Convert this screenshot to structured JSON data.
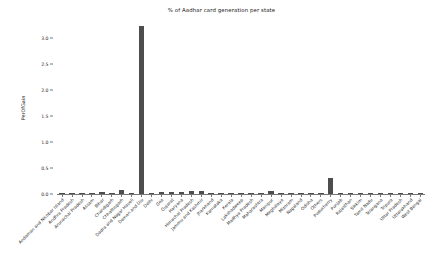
{
  "chart_data": {
    "type": "bar",
    "title": "% of Aadhar card generation per state",
    "xlabel": "",
    "ylabel": "PerOfGain",
    "ylim": [
      0.0,
      3.3
    ],
    "yticks": [
      "0.0",
      "0.5",
      "1.0",
      "1.5",
      "2.0",
      "2.5",
      "3.0"
    ],
    "ytick_values": [
      0.0,
      0.5,
      1.0,
      1.5,
      2.0,
      2.5,
      3.0
    ],
    "grid": false,
    "legend": null,
    "bar_color": "#4d4d4d",
    "categories": [
      "Andaman and Nicobar Island",
      "Andhra Pradesh",
      "Arunachal Pradesh",
      "Assam",
      "Bihar",
      "Chandigarh",
      "Chhattisgarh",
      "Dadra and Nagar Haveli",
      "Daman and Diu",
      "Delhi",
      "Goa",
      "Gujarat",
      "Haryana",
      "Himachal Pradesh",
      "Jammu and Kashmir",
      "Jharkhand",
      "Karnataka",
      "Kerala",
      "Lakshadweep",
      "Madhya Pradesh",
      "Maharashtra",
      "Manipur",
      "Meghalaya",
      "Mizoram",
      "Nagaland",
      "Odisha",
      "Others",
      "Puducherry",
      "Punjab",
      "Rajasthan",
      "Sikkim",
      "Tamil Nadu",
      "Telangana",
      "Tripura",
      "Uttar Pradesh",
      "Uttarakhand",
      "West Bengal"
    ],
    "values": [
      0.004,
      0.006,
      0.006,
      0.007,
      0.045,
      0.01,
      0.07,
      0.012,
      3.22,
      0.02,
      0.03,
      0.04,
      0.04,
      0.05,
      0.05,
      0.012,
      0.008,
      0.01,
      0.012,
      0.02,
      0.02,
      0.05,
      0.01,
      0.012,
      0.012,
      0.012,
      0.012,
      0.3,
      0.012,
      0.012,
      0.004,
      0.004,
      0.008,
      0.008,
      0.004,
      0.02,
      0.02
    ]
  }
}
